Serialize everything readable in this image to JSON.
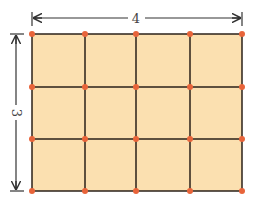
{
  "diagram": {
    "type": "grid",
    "columns": 4,
    "rows": 3,
    "width_label": "4",
    "height_label": "3",
    "colors": {
      "fill": "#fbe0b0",
      "lines": "#2a2018",
      "dots": "#e8643a",
      "arrows": "#333333"
    }
  }
}
